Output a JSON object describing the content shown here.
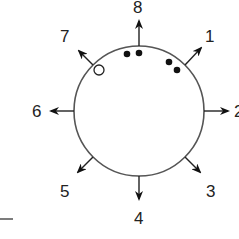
{
  "diagram": {
    "type": "circular-direction-diagram",
    "circle": {
      "cx": 139,
      "cy": 111,
      "r": 65
    },
    "directions": [
      {
        "label": "1",
        "angle_deg": 45
      },
      {
        "label": "2",
        "angle_deg": 0
      },
      {
        "label": "3",
        "angle_deg": -45
      },
      {
        "label": "4",
        "angle_deg": -90
      },
      {
        "label": "5",
        "angle_deg": -135
      },
      {
        "label": "6",
        "angle_deg": 180
      },
      {
        "label": "7",
        "angle_deg": 135
      },
      {
        "label": "8",
        "angle_deg": 90
      }
    ],
    "filled_dots": [
      {
        "x": 127,
        "y": 54
      },
      {
        "x": 139,
        "y": 53
      },
      {
        "x": 169,
        "y": 62
      },
      {
        "x": 177,
        "y": 70
      }
    ],
    "open_dots": [
      {
        "x": 99,
        "y": 70
      }
    ],
    "colors": {
      "line": "#555555",
      "dot": "#111111",
      "text": "#222222"
    }
  }
}
